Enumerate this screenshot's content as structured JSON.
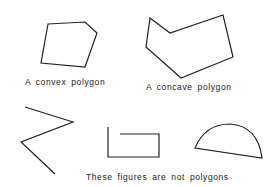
{
  "labels": {
    "convex": "A convex polygon",
    "concave": "A concave polygon",
    "not_polygons": "These figures are not polygons"
  },
  "figures": {
    "convex_polygon": {
      "points": "48,24 85,22 97,33 85,67 41,63",
      "closed": true
    },
    "concave_polygon": {
      "points": "150,18 170,33 223,15 233,57 181,78 146,47",
      "closed": true
    },
    "self_intersecting": {
      "points": "25,107 73,122 21,142 55,174",
      "closed": false
    },
    "open_rectangle": {
      "points": "120,134 159,134 159,157 108,157 108,127",
      "closed": false
    },
    "semicircle": {
      "path": "M195,148 Q205,124 230,124 Q258,126 262,158 Z"
    }
  },
  "colors": {
    "stroke": "#222222",
    "background": "#ffffff"
  }
}
